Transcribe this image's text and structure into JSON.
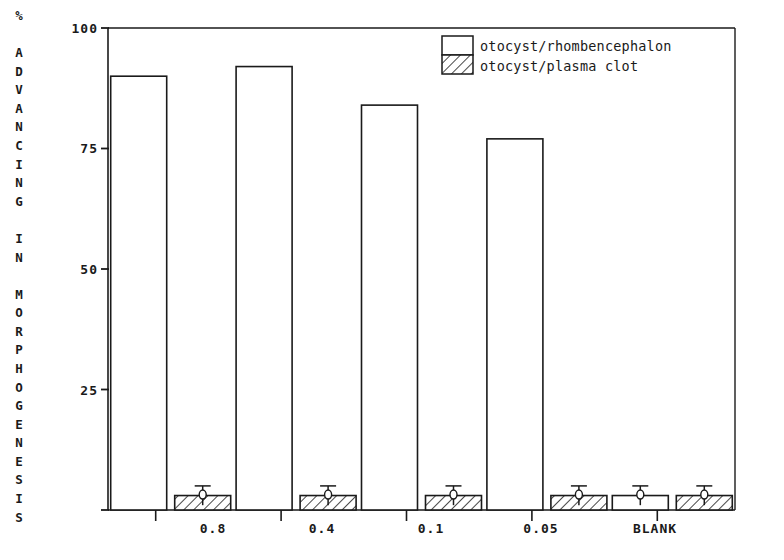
{
  "chart_data": {
    "type": "bar",
    "title": "",
    "subtitle": "",
    "xlabel": "",
    "ylabel": "% ADVANCING IN MORPHOGENESIS",
    "categories": [
      "0.8",
      "0.4",
      "0.1",
      "0.05",
      "BLANK"
    ],
    "series": [
      {
        "name": "otocyst/rhombencephalon",
        "fill": "none",
        "values": [
          90,
          92,
          84,
          77,
          3
        ]
      },
      {
        "name": "otocyst/plasma clot",
        "fill": "hatch",
        "values": [
          3,
          3,
          3,
          3,
          3
        ]
      }
    ],
    "errorbars": {
      "otocyst/rhombencephalon": [
        null,
        null,
        null,
        null,
        2
      ],
      "otocyst/plasma clot": [
        2,
        2,
        2,
        2,
        2
      ]
    },
    "ylim": [
      0,
      100
    ],
    "yticks": [
      0,
      25,
      50,
      75,
      100
    ],
    "ytick_labels": [
      "",
      "25",
      "50",
      "75",
      "100"
    ],
    "grid": false,
    "legend_position": "top-right",
    "legend_entries": [
      "otocyst/rhombencephalon",
      "otocyst/plasma clot"
    ],
    "axis_color": "#1a1a1a"
  },
  "axis": {
    "y_title_chars": [
      "%",
      " ",
      "A",
      "D",
      "V",
      "A",
      "N",
      "C",
      "I",
      "N",
      "G",
      " ",
      "I",
      "N",
      " ",
      "M",
      "O",
      "R",
      "P",
      "H",
      "O",
      "G",
      "E",
      "N",
      "E",
      "S",
      "I",
      "S"
    ],
    "ytick_100": "100",
    "ytick_75": "75",
    "ytick_50": "50",
    "ytick_25": "25",
    "xtick_1": "0.8",
    "xtick_2": "0.4",
    "xtick_3": "0.1",
    "xtick_4": "0.05",
    "xtick_5": "BLANK"
  },
  "legend": {
    "item_1": "otocyst/rhombencephalon",
    "item_2": "otocyst/plasma clot"
  }
}
